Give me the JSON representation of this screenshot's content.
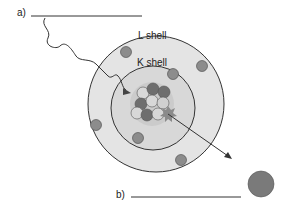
{
  "labels": {
    "a": "a)",
    "b": "b)",
    "l_shell": "L shell",
    "k_shell": "K shell"
  },
  "colors": {
    "outer_shell_fill": "#e2e2e2",
    "inner_shell_fill": "#d6d6d6",
    "nucleus_fill": "#c8c8c8",
    "electron": "#8c8c8c",
    "dark_nucleon": "#6e6e6e",
    "light_nucleon": "#d8d8d8",
    "ejected_particle": "#7a7a7a",
    "line": "#333333"
  }
}
